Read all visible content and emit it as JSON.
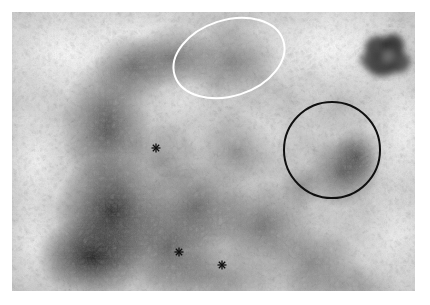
{
  "page": {
    "width": 430,
    "height": 305,
    "background_color": "#ffffff",
    "type": "scientific-micrograph-figure"
  },
  "micrograph": {
    "name": "grayscale-electron-micrograph",
    "left": 12,
    "top": 12,
    "width": 403,
    "height": 279,
    "description": "Grayscale granular micrograph with dark mottled tissue regions on the left and lower-center, light background at upper-left and upper-right",
    "base_color": "#d9d9d9",
    "dark_tone": "#1b1b1b",
    "mid_tone": "#7a7a7a",
    "light_tone": "#f2f2f2"
  },
  "annotations": {
    "ellipse": {
      "label": "white-ellipse-annotation",
      "color": "#ffffff",
      "stroke_width": 2.0,
      "cx": 229,
      "cy": 58,
      "rx": 57,
      "ry": 38,
      "rotation_deg": -18
    },
    "circle": {
      "label": "black-circle-annotation",
      "color": "#101010",
      "stroke_width": 2.0,
      "cx": 332,
      "cy": 150,
      "r": 48
    },
    "asterisks": [
      {
        "label": "asterisk-marker-1",
        "x": 156,
        "y": 148,
        "size": 9,
        "color": "#101010"
      },
      {
        "label": "asterisk-marker-2",
        "x": 179,
        "y": 252,
        "size": 9,
        "color": "#101010"
      },
      {
        "label": "asterisk-marker-3",
        "x": 222,
        "y": 265,
        "size": 9,
        "color": "#101010"
      }
    ],
    "dark_blob": {
      "label": "dark-blob-upper-right",
      "cx": 378,
      "cy": 45,
      "rx": 22,
      "ry": 17,
      "color": "#2a2a2a"
    }
  },
  "chart_data": {
    "type": "heatmap",
    "title": "",
    "xlabel": "",
    "ylabel": "",
    "grid": false,
    "legend": false,
    "intensity_range": [
      0,
      255
    ],
    "regions": [
      {
        "name": "upper-left-light",
        "cx": 55,
        "cy": 45,
        "intensity": 238
      },
      {
        "name": "upper-right-light",
        "cx": 320,
        "cy": 40,
        "intensity": 242
      },
      {
        "name": "left-dark-band",
        "cx": 95,
        "cy": 120,
        "intensity": 70
      },
      {
        "name": "center-dark-mass",
        "cx": 170,
        "cy": 190,
        "intensity": 60
      },
      {
        "name": "lower-left-very-dark",
        "cx": 95,
        "cy": 250,
        "intensity": 28
      },
      {
        "name": "circle-interior-dark-cluster",
        "cx": 335,
        "cy": 160,
        "intensity": 62
      },
      {
        "name": "ellipse-interior-mid",
        "cx": 229,
        "cy": 58,
        "intensity": 120
      },
      {
        "name": "right-mid-light",
        "cx": 395,
        "cy": 230,
        "intensity": 200
      },
      {
        "name": "blob-upper-right",
        "cx": 378,
        "cy": 45,
        "intensity": 45
      }
    ]
  }
}
